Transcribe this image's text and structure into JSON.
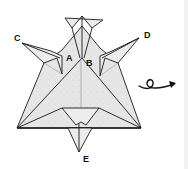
{
  "diagram": {
    "labels": {
      "a": "A",
      "b": "B",
      "c": "C",
      "d": "D",
      "e": "E"
    },
    "instruction_icon": "turn-over-icon",
    "colors": {
      "paper": "#e4e4e4",
      "line": "#1a1a1a",
      "background": "#ffffff"
    }
  }
}
